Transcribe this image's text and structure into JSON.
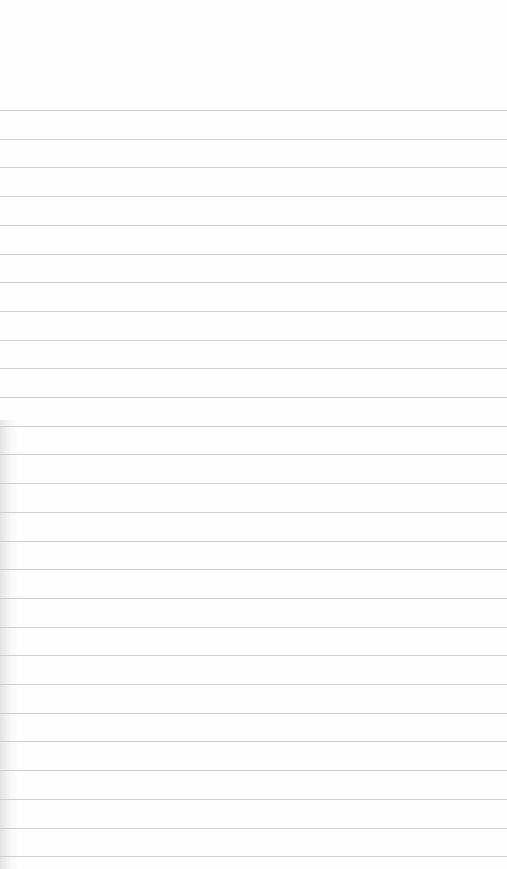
{
  "notepad": {
    "ruled_line_count": 27,
    "first_line_y": 110,
    "line_spacing": 28.7,
    "line_color": "#cfcfcf",
    "paper_color": "#fefefe",
    "text": ""
  }
}
